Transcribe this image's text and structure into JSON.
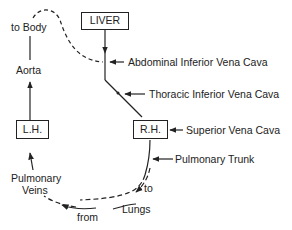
{
  "diagram": {
    "nodes": {
      "liver": "LIVER",
      "rh": "R.H.",
      "lh": "L.H."
    },
    "labels": {
      "to_body": "to Body",
      "aorta": "Aorta",
      "abdominal_ivc": "Abdominal Inferior Vena Cava",
      "thoracic_ivc": "Thoracic Inferior Vena Cava",
      "superior_vc": "Superior Vena Cava",
      "pulmonary_trunk": "Pulmonary Trunk",
      "to": "to",
      "lungs": "Lungs",
      "from": "from",
      "pulmonary": "Pulmonary",
      "veins": "Veins"
    },
    "colors": {
      "ink": "#222222",
      "background": "#ffffff"
    }
  }
}
